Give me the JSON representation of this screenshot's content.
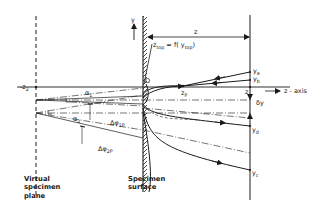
{
  "diagram": {
    "title": "",
    "labels": {
      "y_axis": "y",
      "origin": "O",
      "z_axis": "z - axis",
      "z_dimension": "z",
      "z_at_detector": "z",
      "neg_z2": "-z",
      "neg_z2_sub": "2",
      "ztop_main": "z",
      "ztop_sub": "top",
      "ztop_eq": " = f( y",
      "ztop_eq_sub": "top",
      "ztop_close": ")",
      "zp_main": "z",
      "zp_sub": "P",
      "ya_main": "y",
      "ya_sub": "a",
      "yb_main": "y",
      "yb_sub": "b",
      "yd_main": "y",
      "yd_sub": "d",
      "yc_main": "y",
      "yc_sub": "c",
      "delta_y": "δy",
      "alpha1_main": "α",
      "alpha1_sub": "1",
      "alpha2_main": "α",
      "alpha2_sub": "2",
      "dphi1p_main": "Δφ",
      "dphi1p_sub": "1P",
      "dphi2p_main": "Δφ",
      "dphi2p_sub": "2P"
    },
    "captions": {
      "virtual_plane": "Virtual\nspecimen\nplane",
      "specimen_surface": "Specimen\nsurface"
    },
    "colors": {
      "ink": "#1a1a1a",
      "background": "#ffffff"
    }
  }
}
